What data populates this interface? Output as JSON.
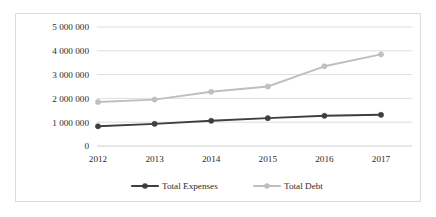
{
  "chart_data": {
    "type": "line",
    "title": "",
    "xlabel": "",
    "ylabel": "",
    "categories": [
      "2012",
      "2013",
      "2014",
      "2015",
      "2016",
      "2017"
    ],
    "x": [
      2012,
      2013,
      2014,
      2015,
      2016,
      2017
    ],
    "series": [
      {
        "name": "Total Expenses",
        "color": "#3f3f3f",
        "marker": "circle",
        "values": [
          830000,
          930000,
          1060000,
          1170000,
          1270000,
          1310000
        ]
      },
      {
        "name": "Total Debt",
        "color": "#bfbfbf",
        "marker": "circle",
        "values": [
          1850000,
          1950000,
          2280000,
          2500000,
          3350000,
          3850000
        ]
      }
    ],
    "ylim": [
      0,
      5000000
    ],
    "yticks": [
      0,
      1000000,
      2000000,
      3000000,
      4000000,
      5000000
    ],
    "ytick_labels": [
      "0",
      "1 000 000",
      "2 000 000",
      "3 000 000",
      "4 000 000",
      "5 000 000"
    ],
    "grid": true,
    "grid_axis": "y",
    "legend_position": "bottom",
    "legend_entries": [
      "Total Expenses",
      "Total Debt"
    ],
    "border_color": "#dcdcdc",
    "gridline_color": "#d4d4d4",
    "background": "#ffffff"
  }
}
